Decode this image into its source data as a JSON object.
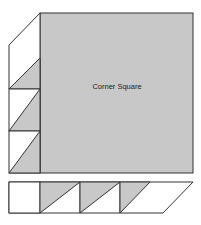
{
  "diagram": {
    "title": "Corner Square",
    "colors": {
      "fill_grey": "#c8c8c8",
      "fill_white": "#ffffff",
      "stroke": "#333333"
    },
    "corner_square": {
      "label": "Corner Square",
      "x": 40,
      "y": 13,
      "width": 153,
      "height": 160
    },
    "left_strip": {
      "sections": 3,
      "description": "Three stacked cells on the left, each with a grey half-square triangle; top cell slants to meet the square's top-left corner"
    },
    "bottom_strip": {
      "cells": [
        {
          "type": "white-square"
        },
        {
          "type": "half-square-triangle"
        },
        {
          "type": "half-square-triangle"
        },
        {
          "type": "half-square-triangle"
        },
        {
          "type": "white-parallelogram-end"
        }
      ]
    }
  }
}
